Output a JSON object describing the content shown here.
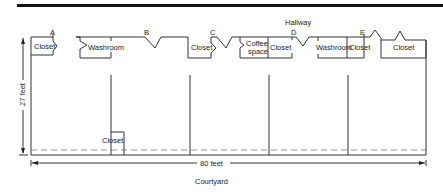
{
  "diagram": {
    "top_label": "Hallway",
    "bottom_label": "Courtyard",
    "dimensions": {
      "height_label": "27 feet",
      "width_label": "80 feet"
    },
    "doors": [
      "A",
      "B",
      "C",
      "D",
      "E"
    ],
    "rooms": [
      {
        "label": "Closet"
      },
      {
        "label": "Washroom"
      },
      {
        "label": "Closet"
      },
      {
        "label": "Coffee space",
        "lines": [
          "Coffee",
          "space"
        ]
      },
      {
        "label": "Closet"
      },
      {
        "label": "Washroom"
      },
      {
        "label": "Closet"
      },
      {
        "label": "Closet"
      },
      {
        "label": "Closet"
      }
    ]
  }
}
